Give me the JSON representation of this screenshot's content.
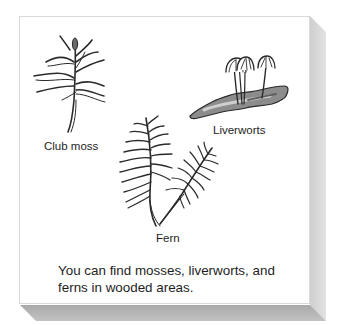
{
  "figure": {
    "labels": {
      "club_moss": "Club moss",
      "liverworts": "Liverworts",
      "fern": "Fern"
    },
    "caption": {
      "line1": "You can find mosses, liverworts, and",
      "line2": "ferns in wooded areas."
    },
    "icons": {
      "club_moss": "club-moss-illustration",
      "liverworts": "liverwort-illustration",
      "fern": "fern-illustration"
    },
    "colors": {
      "card_background": "#ffffff",
      "card_border": "#d9d9d9",
      "right_shadow": "#d6d6d6",
      "bottom_shadow": "#b4b4b4",
      "ink": "#2a2a2a"
    }
  }
}
